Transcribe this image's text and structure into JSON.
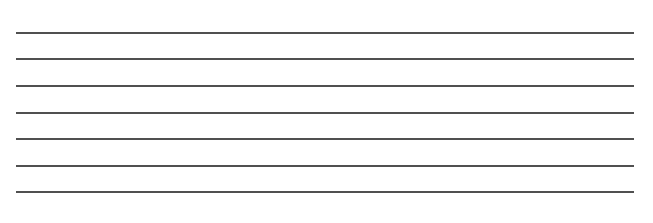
{
  "document": {
    "type": "ruled-lines",
    "line_count": 7,
    "line_color": "#505050",
    "background": "#ffffff",
    "lines": [
      {
        "y": 32,
        "text": ""
      },
      {
        "y": 58,
        "text": ""
      },
      {
        "y": 85,
        "text": ""
      },
      {
        "y": 112,
        "text": ""
      },
      {
        "y": 138,
        "text": ""
      },
      {
        "y": 165,
        "text": ""
      },
      {
        "y": 191,
        "text": ""
      }
    ]
  }
}
